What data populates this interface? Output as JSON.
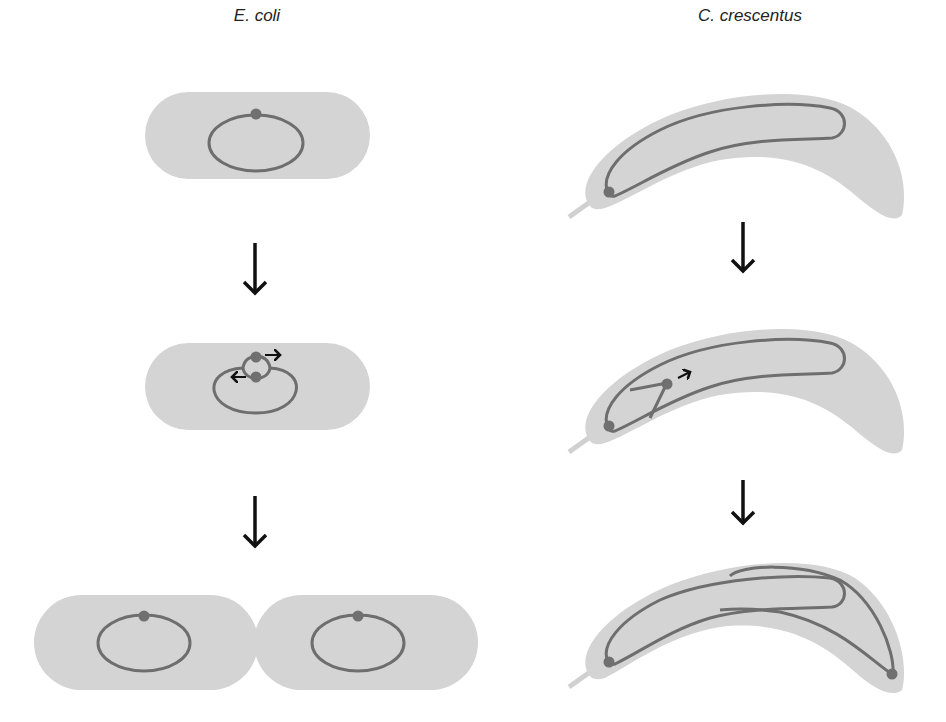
{
  "titles": {
    "left": "E. coli",
    "right": "C. crescentus"
  },
  "colors": {
    "cell_fill": "#d4d4d4",
    "chromosome": "#6e6e6e",
    "origin": "#707070",
    "arrow": "#111111",
    "stalk": "#d0d0d0"
  },
  "panels": {
    "ecoli": [
      "single cell, one chromosome with origin",
      "replication initiated, two origins moving apart",
      "two daughter cells, each with one chromosome"
    ],
    "ccrescentus": [
      "stalked cell, chromosome with origin at stalked pole",
      "replication initiated, new origin moving toward opposite pole",
      "two origins at opposite poles"
    ]
  }
}
